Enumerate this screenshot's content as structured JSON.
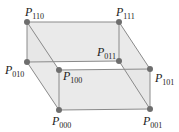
{
  "diagram": {
    "type": "parallelepiped-control-points",
    "colors": {
      "face": "#e6e6e6",
      "edge": "#7a7a7a",
      "vertex": "#6e6e6e",
      "label": "#222222"
    },
    "vertices": [
      {
        "id": "P000",
        "letter": "P",
        "sub": "000",
        "x": 59,
        "y": 110,
        "lx": 52,
        "ly": 114
      },
      {
        "id": "P001",
        "letter": "P",
        "sub": "001",
        "x": 150,
        "y": 109,
        "lx": 143,
        "ly": 113
      },
      {
        "id": "P010",
        "letter": "P",
        "sub": "010",
        "x": 27,
        "y": 62,
        "lx": 5,
        "ly": 64
      },
      {
        "id": "P011",
        "letter": "P",
        "sub": "011",
        "x": 119,
        "y": 61,
        "lx": 98,
        "ly": 47
      },
      {
        "id": "P100",
        "letter": "P",
        "sub": "100",
        "x": 59,
        "y": 70,
        "lx": 63,
        "ly": 70
      },
      {
        "id": "P101",
        "letter": "P",
        "sub": "101",
        "x": 150,
        "y": 69,
        "lx": 155,
        "ly": 73
      },
      {
        "id": "P110",
        "letter": "P",
        "sub": "110",
        "x": 27,
        "y": 22,
        "lx": 25,
        "ly": 6
      },
      {
        "id": "P111",
        "letter": "P",
        "sub": "111",
        "x": 119,
        "y": 22,
        "lx": 116,
        "ly": 6
      }
    ]
  }
}
